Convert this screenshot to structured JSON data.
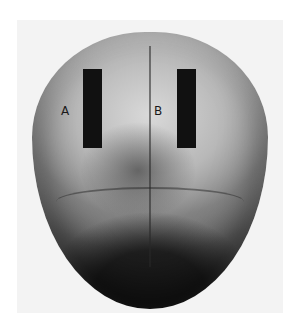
{
  "image": {
    "subject": "skull-top-view-photograph",
    "labels": {
      "a": "A",
      "b": "B"
    },
    "colors": {
      "background": "#ffffff",
      "photo_bg": "#f3f3f3",
      "bar": "#111111"
    }
  }
}
